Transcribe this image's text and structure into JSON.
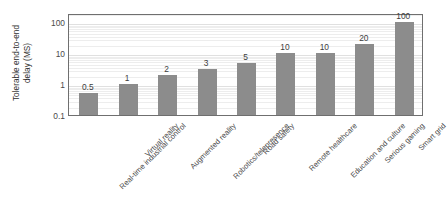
{
  "chart_data": {
    "type": "bar",
    "title": "",
    "xlabel": "",
    "ylabel": "Tolerable end-to-end\ndelay (MS)",
    "yscale": "log",
    "ylim": [
      0.1,
      200
    ],
    "ytick_labels": [
      "100",
      "10",
      "1",
      "0.1"
    ],
    "ytick_values": [
      100,
      10,
      1,
      0.1
    ],
    "grid": true,
    "legend": false,
    "categories": [
      "Real-time industrial control",
      "Virtual reality",
      "Augmented reality",
      "Robotics/telepresence",
      "Road safety",
      "Remote healthcare",
      "Education and culture",
      "Serious gaming",
      "Smart grid"
    ],
    "values": [
      0.5,
      1,
      2,
      3,
      5,
      10,
      10,
      20,
      100
    ],
    "data_labels": [
      "0.5",
      "1",
      "2",
      "3",
      "5",
      "10",
      "10",
      "20",
      "100"
    ],
    "bar_color": "#8c8c8c",
    "background_color": "#ffffff",
    "axis_color": "#6f6f6f"
  }
}
